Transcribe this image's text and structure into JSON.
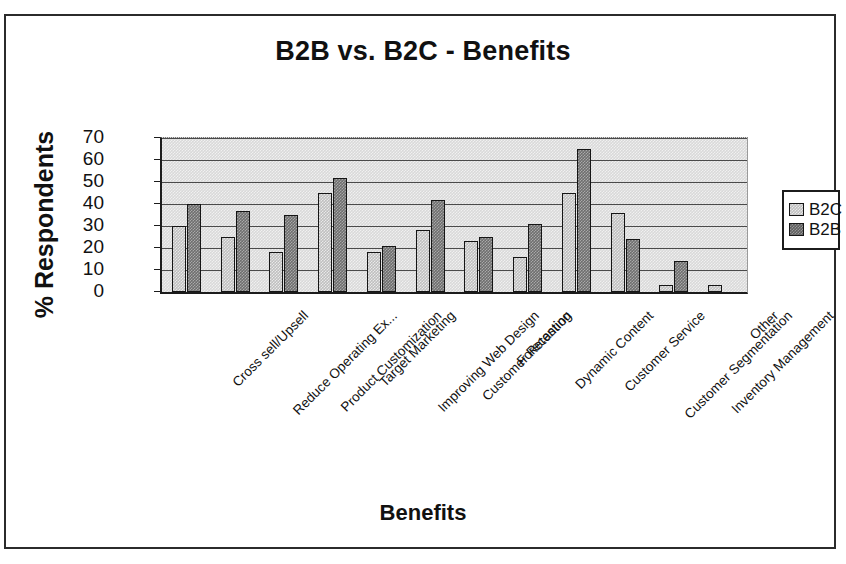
{
  "chart_data": {
    "type": "bar",
    "title": "B2B vs. B2C - Benefits",
    "xlabel": "Benefits",
    "ylabel": "% Respondents",
    "ylim": [
      0,
      70
    ],
    "yticks": [
      0,
      10,
      20,
      30,
      40,
      50,
      60,
      70
    ],
    "grid": true,
    "legend_position": "right",
    "categories": [
      "Cross sell/Upsell",
      "Reduce Operating Ex...",
      "Product Customization",
      "Target Marketing",
      "Improving Web Design",
      "Customer Retention",
      "Forecasting",
      "Dynamic Content",
      "Customer Service",
      "Customer Segmentation",
      "Inventory Management",
      "Other"
    ],
    "series": [
      {
        "name": "B2C",
        "color": "#bfbfbf",
        "values": [
          30,
          25,
          18,
          45,
          18,
          28,
          23,
          16,
          45,
          36,
          3,
          3
        ]
      },
      {
        "name": "B2B",
        "color": "#6e6e6e",
        "values": [
          40,
          37,
          35,
          52,
          21,
          42,
          25,
          31,
          65,
          24,
          14,
          0
        ]
      }
    ]
  },
  "legend": {
    "items": [
      {
        "label": "B2C",
        "series": "B2C"
      },
      {
        "label": "B2B",
        "series": "B2B"
      }
    ]
  }
}
